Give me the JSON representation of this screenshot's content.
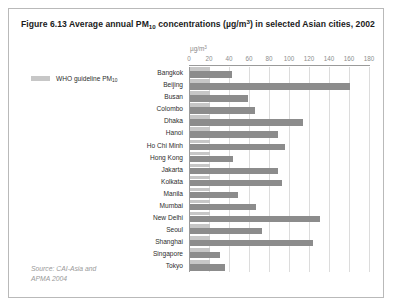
{
  "figure": {
    "title_prefix": "Figure 6.13 Average annual PM",
    "title_subscript": "10",
    "title_mid": " concentrations (µg/m",
    "title_sup": "3",
    "title_suffix": ") in selected Asian cities, 2002",
    "source": "Source: CAI-Asia and\nAPMA 2004"
  },
  "legend": {
    "label_text": "WHO guideline PM",
    "label_subscript": "10",
    "swatch_color": "#c7c7c7"
  },
  "axis": {
    "unit_prefix": "µg/m",
    "unit_sup": "3"
  },
  "colors": {
    "bar_value": "#8c8c8c",
    "bar_guide": "#c7c7c7",
    "gridline": "#dcdcdc",
    "axis": "#9a9a9a",
    "border": "#b9b9b9"
  },
  "chart_data": {
    "type": "bar",
    "orientation": "horizontal",
    "title": "Figure 6.13 Average annual PM10 concentrations (µg/m3) in selected Asian cities, 2002",
    "xlabel": "µg/m3",
    "ylabel": "",
    "xlim": [
      0,
      180
    ],
    "xticks": [
      0,
      20,
      40,
      60,
      80,
      100,
      120,
      140,
      160,
      180
    ],
    "grid": true,
    "legend_position": "left",
    "categories": [
      "Bangkok",
      "Beijing",
      "Busan",
      "Colombo",
      "Dhaka",
      "Hanoi",
      "Ho Chi Minh",
      "Hong Kong",
      "Jakarta",
      "Kolkata",
      "Manila",
      "Mumbai",
      "New Delhi",
      "Seoul",
      "Shanghai",
      "Singapore",
      "Tokyo"
    ],
    "series": [
      {
        "name": "Average annual PM10 concentration",
        "color": "#8c8c8c",
        "values": [
          42,
          160,
          58,
          65,
          113,
          88,
          95,
          43,
          88,
          92,
          48,
          66,
          130,
          72,
          123,
          30,
          35
        ]
      },
      {
        "name": "WHO guideline PM10",
        "color": "#c7c7c7",
        "values": [
          20,
          20,
          20,
          20,
          20,
          20,
          20,
          20,
          20,
          20,
          20,
          20,
          20,
          20,
          20,
          20,
          20
        ]
      }
    ]
  }
}
